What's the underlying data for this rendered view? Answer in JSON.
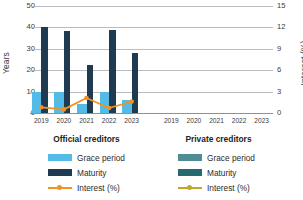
{
  "chart_data": {
    "type": "bar",
    "title": "",
    "subtitle": "",
    "xlabel": "",
    "ylabel": "Years",
    "y2label": "Interest (%)",
    "ylim": [
      0,
      50
    ],
    "y2lim": [
      0,
      15
    ],
    "yticks": [
      0,
      10,
      20,
      30,
      40,
      50
    ],
    "y2ticks": [
      0,
      3,
      6,
      9,
      12,
      15
    ],
    "grid": true,
    "legend_position": "bottom",
    "panels": [
      {
        "name": "official",
        "caption": "Official creditors",
        "categories": [
          "2019",
          "2020",
          "2021",
          "2022",
          "2023"
        ],
        "series": [
          {
            "name": "Grace period",
            "type": "bar",
            "axis": "left",
            "color": "#54bbe6",
            "values": [
              10,
              10,
              4,
              10,
              6
            ]
          },
          {
            "name": "Maturity",
            "type": "bar",
            "axis": "left",
            "color": "#1f3b52",
            "values": [
              40,
              38.5,
              22.5,
              39,
              28
            ]
          },
          {
            "name": "Interest (%)",
            "type": "line",
            "axis": "right",
            "color": "#f29221",
            "values": [
              0.8,
              0.5,
              2.1,
              0.7,
              1.6
            ]
          }
        ]
      },
      {
        "name": "private",
        "caption": "Private creditors",
        "categories": [
          "2019",
          "2020",
          "2021",
          "2022",
          "2023"
        ],
        "series": [
          {
            "name": "Grace period",
            "type": "bar",
            "axis": "left",
            "color": "#4e8d91",
            "values": [
              0,
              0,
              0,
              0,
              0
            ]
          },
          {
            "name": "Maturity",
            "type": "bar",
            "axis": "left",
            "color": "#256a6e",
            "values": [
              0,
              0,
              0,
              0,
              0
            ]
          },
          {
            "name": "Interest (%)",
            "type": "line",
            "axis": "right",
            "color": "#bfa72a",
            "values": [
              null,
              null,
              null,
              null,
              null
            ]
          }
        ]
      }
    ]
  },
  "axes": {
    "left_title": "Years",
    "right_title": "Interest (%)",
    "left_ticks": [
      "50",
      "40",
      "30",
      "20",
      "10",
      "0"
    ],
    "right_ticks": [
      "15",
      "12",
      "9",
      "6",
      "3",
      "0"
    ]
  },
  "panels": {
    "official": {
      "caption": "Official creditors",
      "xticks": [
        "2019",
        "2020",
        "2021",
        "2022",
        "2023"
      ]
    },
    "private": {
      "caption": "Private creditors",
      "xticks": [
        "2019",
        "2020",
        "2021",
        "2022",
        "2023"
      ]
    }
  },
  "legend": {
    "official": [
      {
        "label": "Grace period"
      },
      {
        "label": "Maturity"
      },
      {
        "label": "Interest (%)"
      }
    ],
    "private": [
      {
        "label": "Grace period"
      },
      {
        "label": "Maturity"
      },
      {
        "label": "Interest (%)"
      }
    ]
  },
  "colors": {
    "grace_official": "#54bbe6",
    "maturity_official": "#1f3b52",
    "interest_official": "#f29221",
    "grace_private": "#4e8d91",
    "maturity_private": "#256a6e",
    "interest_private": "#bfa72a",
    "grid": "#b9bcc0",
    "text": "#2b2b2b"
  }
}
